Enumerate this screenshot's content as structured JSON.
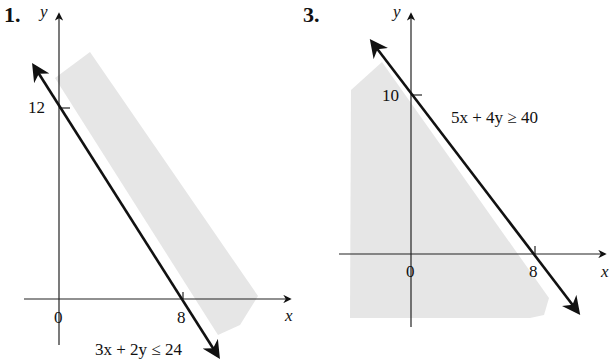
{
  "problems": [
    {
      "number": "1.",
      "inequality": "3x + 2y ≤ 24",
      "x_axis_label": "x",
      "y_axis_label": "y",
      "origin_label": "0",
      "x_intercept_label": "8",
      "y_intercept_label": "12",
      "x_intercept": 8,
      "y_intercept": 12
    },
    {
      "number": "3.",
      "inequality": "5x + 4y ≥ 40",
      "x_axis_label": "x",
      "y_axis_label": "y",
      "origin_label": "0",
      "x_intercept_label": "8",
      "y_intercept_label": "10",
      "x_intercept": 8,
      "y_intercept": 10
    }
  ],
  "colors": {
    "shade": "#e6e6e6",
    "line": "#111111"
  }
}
